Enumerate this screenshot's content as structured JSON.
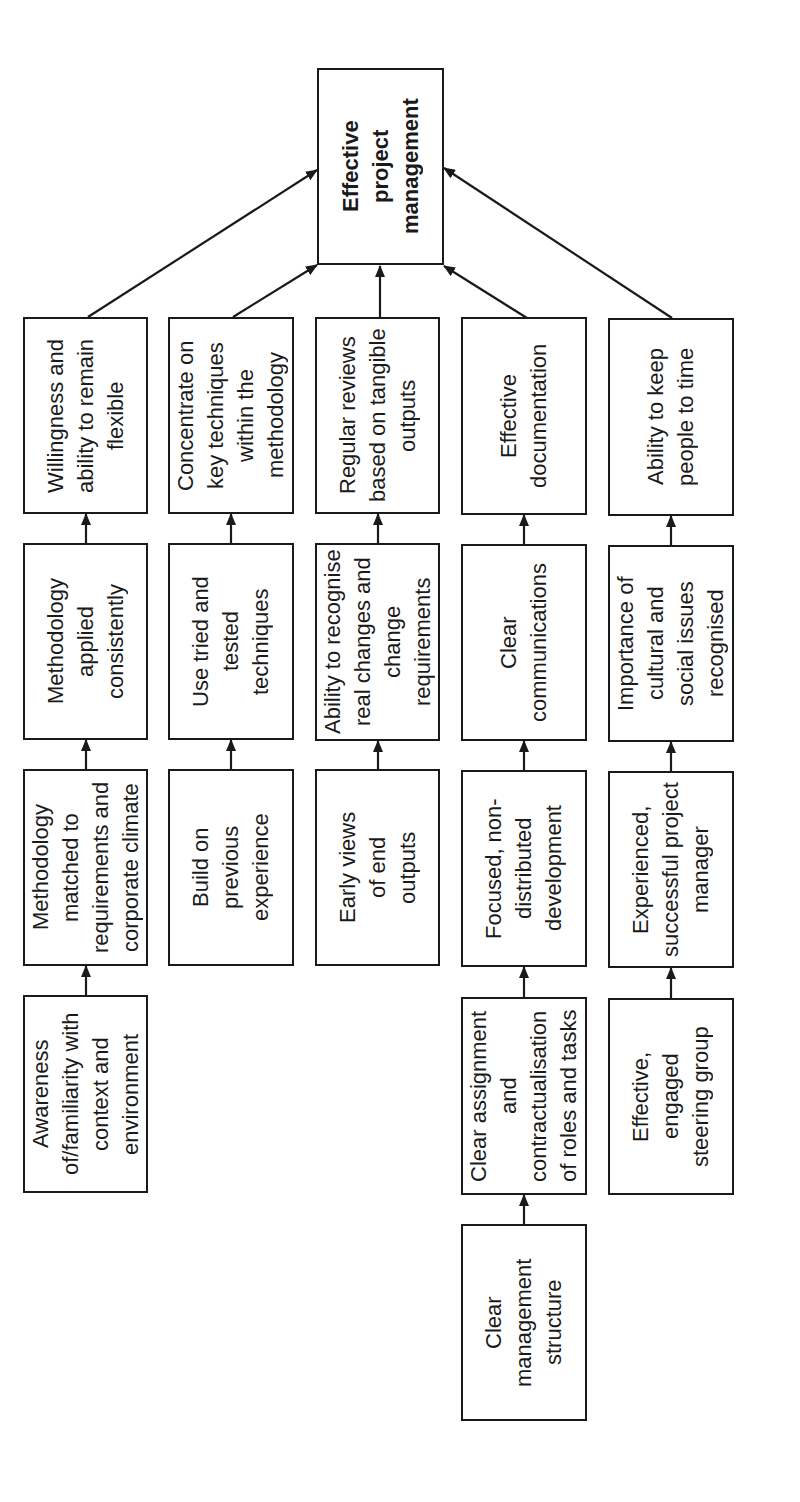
{
  "colors": {
    "stroke": "#1a1a1a",
    "background": "#ffffff"
  },
  "nodes": [
    {
      "lines": [
        "Effective",
        "project",
        "management"
      ]
    },
    {
      "lines": [
        "Willingness and",
        "ability to remain",
        "flexible"
      ]
    },
    {
      "lines": [
        "Concentrate on",
        "key techniques",
        "within the",
        "methodology"
      ]
    },
    {
      "lines": [
        "Regular reviews",
        "based on tangible",
        "outputs"
      ]
    },
    {
      "lines": [
        "Effective",
        "documentation"
      ]
    },
    {
      "lines": [
        "Ability to keep",
        "people to time"
      ]
    },
    {
      "lines": [
        "Methodology",
        "applied",
        "consistently"
      ]
    },
    {
      "lines": [
        "Use tried and",
        "tested",
        "techniques"
      ]
    },
    {
      "lines": [
        "Ability to recognise",
        "real changes and",
        "change",
        "requirements"
      ]
    },
    {
      "lines": [
        "Clear",
        "communications"
      ]
    },
    {
      "lines": [
        "Importance of",
        "cultural and",
        "social issues",
        "recognised"
      ]
    },
    {
      "lines": [
        "Methodology",
        "matched to",
        "requirements and",
        "corporate climate"
      ]
    },
    {
      "lines": [
        "Build on",
        "previous",
        "experience"
      ]
    },
    {
      "lines": [
        "Early views",
        "of end",
        "outputs"
      ]
    },
    {
      "lines": [
        "Focused, non-",
        "distributed",
        "development"
      ]
    },
    {
      "lines": [
        "Experienced,",
        "successful project",
        "manager"
      ]
    },
    {
      "lines": [
        "Awareness",
        "of/familiarity with",
        "context and",
        "environment"
      ]
    },
    {
      "lines": [
        "Clear assignment",
        "and",
        "contractualisation",
        "of roles and tasks"
      ]
    },
    {
      "lines": [
        "Effective,",
        "engaged",
        "steering group"
      ]
    },
    {
      "lines": [
        "Clear",
        "management",
        "structure"
      ]
    }
  ],
  "edges": [
    {
      "from": "Willingness and ability to remain flexible",
      "to": "Effective project management"
    },
    {
      "from": "Concentrate on key techniques within the methodology",
      "to": "Effective project management"
    },
    {
      "from": "Regular reviews based on tangible outputs",
      "to": "Effective project management"
    },
    {
      "from": "Effective documentation",
      "to": "Effective project management"
    },
    {
      "from": "Ability to keep people to time",
      "to": "Effective project management"
    },
    {
      "from": "Methodology applied consistently",
      "to": "Willingness and ability to remain flexible"
    },
    {
      "from": "Methodology matched to requirements and corporate climate",
      "to": "Methodology applied consistently"
    },
    {
      "from": "Awareness of/familiarity with context and environment",
      "to": "Methodology matched to requirements and corporate climate"
    },
    {
      "from": "Use tried and tested techniques",
      "to": "Concentrate on key techniques within the methodology"
    },
    {
      "from": "Build on previous experience",
      "to": "Use tried and tested techniques"
    },
    {
      "from": "Ability to recognise real changes and change requirements",
      "to": "Regular reviews based on tangible outputs"
    },
    {
      "from": "Early views of end outputs",
      "to": "Ability to recognise real changes and change requirements"
    },
    {
      "from": "Clear communications",
      "to": "Effective documentation"
    },
    {
      "from": "Focused, non-distributed development",
      "to": "Clear communications"
    },
    {
      "from": "Clear assignment and contractualisation of roles and tasks",
      "to": "Focused, non-distributed development"
    },
    {
      "from": "Clear management structure",
      "to": "Clear assignment and contractualisation of roles and tasks"
    },
    {
      "from": "Importance of cultural and social issues recognised",
      "to": "Ability to keep people to time"
    },
    {
      "from": "Experienced, successful project manager",
      "to": "Importance of cultural and social issues recognised"
    },
    {
      "from": "Effective, engaged steering group",
      "to": "Experienced, successful project manager"
    }
  ]
}
